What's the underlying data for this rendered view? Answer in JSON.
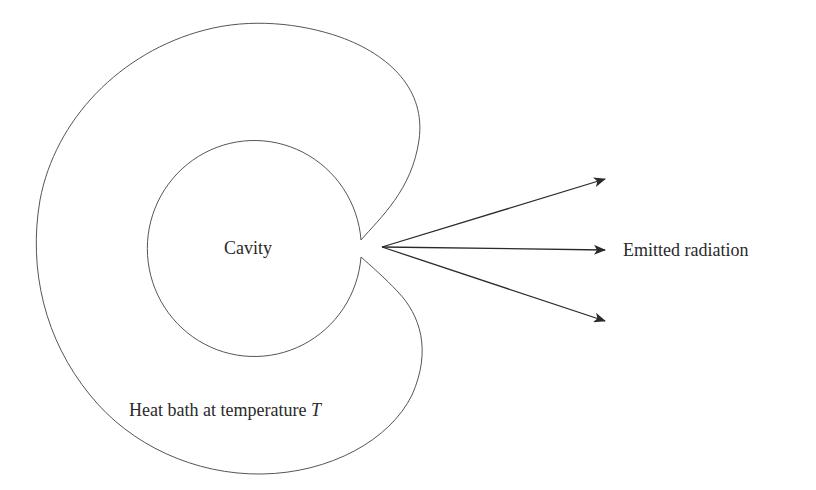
{
  "diagram": {
    "type": "blackbody-cavity-schematic",
    "labels": {
      "cavity": "Cavity",
      "heat_bath_prefix": "Heat bath at temperature ",
      "heat_bath_variable": "T",
      "emitted": "Emitted radiation"
    },
    "colors": {
      "stroke": "#555555",
      "arrow": "#2a2a2a",
      "text": "#2a2a2a",
      "background": "#ffffff"
    },
    "arrows": [
      {
        "name": "upper",
        "from": [
          382,
          247
        ],
        "to": [
          605,
          179
        ]
      },
      {
        "name": "middle",
        "from": [
          382,
          247
        ],
        "to": [
          605,
          250
        ]
      },
      {
        "name": "lower",
        "from": [
          382,
          247
        ],
        "to": [
          605,
          321
        ]
      }
    ]
  }
}
